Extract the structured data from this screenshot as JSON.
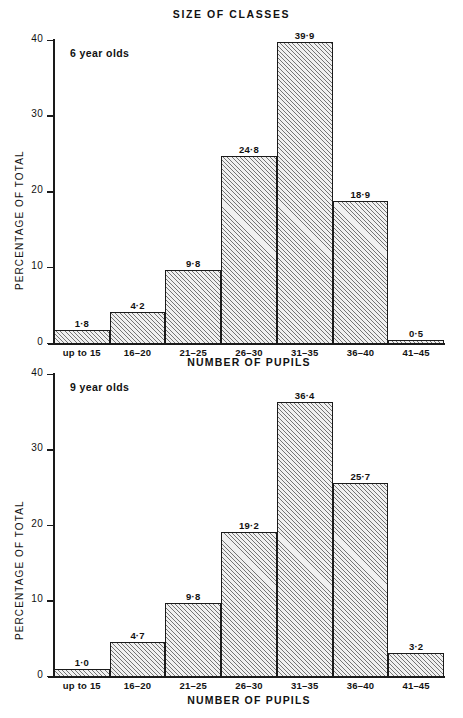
{
  "title": "SIZE OF CLASSES",
  "axis": {
    "x_label": "NUMBER OF PUPILS",
    "y_label": "PERCENTAGE OF TOTAL",
    "y_ticks": [
      "0",
      "10",
      "20",
      "30",
      "40"
    ]
  },
  "panels": [
    {
      "series_label": "6 year olds",
      "value_labels": [
        "1·8",
        "4·2",
        "9·8",
        "24·8",
        "39·9",
        "18·9",
        "0·5"
      ]
    },
    {
      "series_label": "9 year olds",
      "value_labels": [
        "1·0",
        "4·7",
        "9·8",
        "19·2",
        "36·4",
        "25·7",
        "3·2"
      ]
    }
  ],
  "categories": [
    "up to 15",
    "16–20",
    "21–25",
    "26–30",
    "31–35",
    "36–40",
    "41–45"
  ],
  "colors": {
    "ink": "#1a1a1a",
    "bar_fill": "#f0f0f0",
    "background": "#ffffff"
  },
  "chart_data": [
    {
      "type": "bar",
      "title": "SIZE OF CLASSES",
      "subtitle": "6 year olds",
      "xlabel": "NUMBER OF PUPILS",
      "ylabel": "PERCENTAGE OF TOTAL",
      "categories": [
        "up to 15",
        "16-20",
        "21-25",
        "26-30",
        "31-35",
        "36-40",
        "41-45"
      ],
      "values": [
        1.8,
        4.2,
        9.8,
        24.8,
        39.9,
        18.9,
        0.5
      ],
      "data_labels": [
        "1·8",
        "4·2",
        "9·8",
        "24·8",
        "39·9",
        "18·9",
        "0·5"
      ],
      "ylim": [
        0,
        40
      ],
      "yticks": [
        0,
        10,
        20,
        30,
        40
      ],
      "grid": false,
      "legend": "none"
    },
    {
      "type": "bar",
      "title": "SIZE OF CLASSES",
      "subtitle": "9 year olds",
      "xlabel": "NUMBER OF PUPILS",
      "ylabel": "PERCENTAGE OF TOTAL",
      "categories": [
        "up to 15",
        "16-20",
        "21-25",
        "26-30",
        "31-35",
        "36-40",
        "41-45"
      ],
      "values": [
        1.0,
        4.7,
        9.8,
        19.2,
        36.4,
        25.7,
        3.2
      ],
      "data_labels": [
        "1·0",
        "4·7",
        "9·8",
        "19·2",
        "36·4",
        "25·7",
        "3·2"
      ],
      "ylim": [
        0,
        40
      ],
      "yticks": [
        0,
        10,
        20,
        30,
        40
      ],
      "grid": false,
      "legend": "none"
    }
  ]
}
